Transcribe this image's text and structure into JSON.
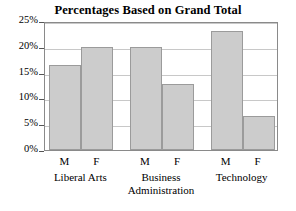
{
  "chart_data": {
    "type": "bar",
    "title": "Percentages Based on Grand Total",
    "xlabel": "",
    "ylabel": "",
    "ylim": [
      0,
      25
    ],
    "grid": true,
    "legend": "none",
    "ytick_labels": [
      "25%",
      "20%",
      "15%",
      "10%",
      "5%",
      "0%"
    ],
    "ytick_values": [
      25,
      20,
      15,
      10,
      5,
      0
    ],
    "categories": [
      "Liberal Arts",
      "Business Administration",
      "Technology"
    ],
    "subcategories": [
      "M",
      "F"
    ],
    "bars": [
      {
        "group": "Liberal Arts",
        "sub": "M",
        "value": 16.5
      },
      {
        "group": "Liberal Arts",
        "sub": "F",
        "value": 20.0
      },
      {
        "group": "Business Administration",
        "sub": "M",
        "value": 20.0
      },
      {
        "group": "Business Administration",
        "sub": "F",
        "value": 12.7
      },
      {
        "group": "Technology",
        "sub": "M",
        "value": 23.0
      },
      {
        "group": "Technology",
        "sub": "F",
        "value": 6.5
      }
    ],
    "series": [
      {
        "name": "M",
        "values": [
          16.5,
          20.0,
          23.0
        ]
      },
      {
        "name": "F",
        "values": [
          20.0,
          12.7,
          6.5
        ]
      }
    ],
    "group_label_lines": [
      [
        "Liberal Arts"
      ],
      [
        "Business",
        "Administration"
      ],
      [
        "Technology"
      ]
    ],
    "colors": {
      "bar_fill": "#cccccc",
      "bar_border": "#9b9b9b",
      "gridline": "#c8c8c8",
      "frame": "#8a8a8a",
      "text": "#000000",
      "background": "#ffffff"
    }
  }
}
